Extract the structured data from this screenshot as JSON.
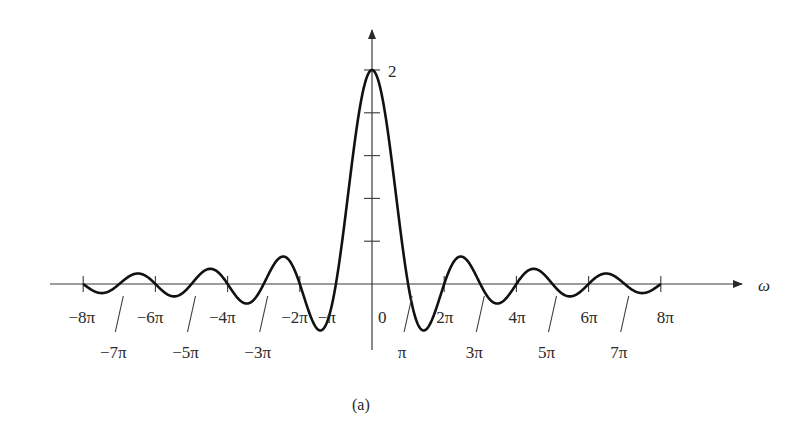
{
  "chart_data": {
    "type": "line",
    "title": "",
    "caption": "(a)",
    "function": "2*sin(w)/w",
    "xlabel": "ω",
    "ylabel": "",
    "xlim_pi_units": [
      -8,
      8
    ],
    "ylim": [
      -0.5,
      2.2
    ],
    "y_peak_label": "2",
    "y_ticks": [
      0.4,
      0.8,
      1.2,
      1.6,
      2.0
    ],
    "x_tick_labels_upper": [
      {
        "pos": -8,
        "label": "−8π"
      },
      {
        "pos": -6,
        "label": "−6π"
      },
      {
        "pos": -4,
        "label": "−4π"
      },
      {
        "pos": -2,
        "label": "−2π"
      },
      {
        "pos": -1,
        "label": "−π"
      },
      {
        "pos": 0,
        "label": "0"
      },
      {
        "pos": 2,
        "label": "2π"
      },
      {
        "pos": 4,
        "label": "4π"
      },
      {
        "pos": 6,
        "label": "6π"
      },
      {
        "pos": 8,
        "label": "8π"
      }
    ],
    "x_tick_labels_lower": [
      {
        "pos": -7,
        "label": "−7π"
      },
      {
        "pos": -5,
        "label": "−5π"
      },
      {
        "pos": -3,
        "label": "−3π"
      },
      {
        "pos": 1,
        "label": "π"
      },
      {
        "pos": 3,
        "label": "3π"
      },
      {
        "pos": 5,
        "label": "5π"
      },
      {
        "pos": 7,
        "label": "7π"
      }
    ],
    "series": [
      {
        "name": "X(ω)",
        "x_pi_units": [
          -8,
          -7.5,
          -7,
          -6.5,
          -6,
          -5.5,
          -5,
          -4.5,
          -4,
          -3.5,
          -3,
          -2.5,
          -2,
          -1.5,
          -1,
          -0.5,
          0,
          0.5,
          1,
          1.5,
          2,
          2.5,
          3,
          3.5,
          4,
          4.5,
          5,
          5.5,
          6,
          6.5,
          7,
          7.5,
          8
        ],
        "values": [
          0,
          -0.085,
          0,
          0.098,
          0,
          -0.116,
          0,
          0.141,
          0,
          -0.182,
          0,
          0.255,
          0,
          -0.424,
          0,
          1.273,
          2,
          1.273,
          0,
          -0.424,
          0,
          0.255,
          0,
          -0.182,
          0,
          0.141,
          0,
          -0.116,
          0,
          0.098,
          0,
          -0.085,
          0
        ]
      }
    ]
  }
}
